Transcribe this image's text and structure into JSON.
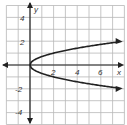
{
  "chart_data": {
    "type": "line",
    "title": "",
    "xlabel": "x",
    "ylabel": "y",
    "xlim": [
      -2,
      8
    ],
    "ylim": [
      -5,
      5
    ],
    "grid": true,
    "x_ticks": [
      "2",
      "4",
      "6"
    ],
    "y_ticks": [
      "4",
      "2",
      "-2",
      "-4"
    ],
    "series": [
      {
        "name": "upper branch",
        "x": [
          0,
          0.5,
          1,
          2,
          3,
          4,
          5,
          6,
          7.5
        ],
        "y": [
          0,
          0.5,
          0.71,
          1.0,
          1.22,
          1.41,
          1.58,
          1.73,
          1.94
        ]
      },
      {
        "name": "lower branch",
        "x": [
          0,
          0.5,
          1,
          2,
          3,
          4,
          5,
          6,
          7.5
        ],
        "y": [
          0,
          -0.5,
          -0.71,
          -1.0,
          -1.22,
          -1.41,
          -1.58,
          -1.73,
          -1.94
        ]
      }
    ],
    "colors": {
      "grid": "#b8b8b8",
      "axes": "#222222",
      "curve": "#222222"
    }
  },
  "labels": {
    "x_axis": "x",
    "y_axis": "y",
    "x_tick_2": "2",
    "x_tick_4": "4",
    "x_tick_6": "6",
    "y_tick_4": "4",
    "y_tick_2": "2",
    "y_tick_m2": "-2",
    "y_tick_m4": "-4"
  }
}
